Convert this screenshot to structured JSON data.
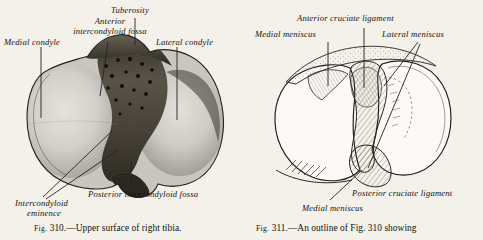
{
  "page": {
    "background_color": "#f3f1ea",
    "ink_color": "#14120f"
  },
  "figure_left": {
    "id": "fig-310",
    "caption_prefix": "Fig.",
    "caption_number": "310.",
    "caption_text": "—Upper surface of right tibia.",
    "caption_full": "Fig. 310.—Upper surface of right tibia.",
    "style": "halftone photograph of bone",
    "labels": [
      {
        "name": "medial-condyle",
        "text": "Medial condyle",
        "lines": [
          "Medial condyle"
        ]
      },
      {
        "name": "anterior-intercondyloid-fossa",
        "text": "Anterior intercondyloid fossa",
        "lines": [
          "Anterior",
          "intercondyloid fossa"
        ]
      },
      {
        "name": "tuberosity",
        "text": "Tuberosity",
        "lines": [
          "Tuberosity"
        ]
      },
      {
        "name": "lateral-condyle",
        "text": "Lateral condyle",
        "lines": [
          "Lateral condyle"
        ]
      },
      {
        "name": "posterior-intercondyloid-fossa",
        "text": "Posterior intercondyloid fossa",
        "lines": [
          "Posterior intercondyloid fossa"
        ]
      },
      {
        "name": "intercondyloid-eminence",
        "text": "Intercondyloid eminence",
        "lines": [
          "Intercondyloid",
          "eminence"
        ]
      }
    ]
  },
  "figure_right": {
    "id": "fig-311",
    "caption_prefix": "Fig.",
    "caption_number": "311.",
    "caption_text": "—An outline of Fig. 310 showing",
    "caption_full": "Fig. 311.—An outline of Fig. 310 showing",
    "caption_truncated": true,
    "style": "line drawing outline with hatching",
    "labels": [
      {
        "name": "anterior-cruciate-ligament",
        "text": "Anterior cruciate ligament",
        "lines": [
          "Anterior cruciate ligament"
        ]
      },
      {
        "name": "medial-meniscus-top",
        "text": "Medial meniscus",
        "lines": [
          "Medial meniscus"
        ]
      },
      {
        "name": "lateral-meniscus",
        "text": "Lateral meniscus",
        "lines": [
          "Lateral meniscus"
        ]
      },
      {
        "name": "posterior-cruciate-ligament",
        "text": "Posterior cruciate ligament",
        "lines": [
          "Posterior cruciate ligament"
        ]
      },
      {
        "name": "medial-meniscus-bottom",
        "text": "Medial meniscus",
        "lines": [
          "Medial meniscus"
        ]
      }
    ]
  }
}
